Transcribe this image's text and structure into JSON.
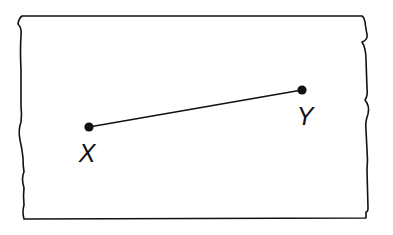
{
  "diagram": {
    "type": "line-segment",
    "colors": {
      "background": "#ffffff",
      "stroke": "#111111"
    },
    "points": [
      {
        "id": "X",
        "label": "X",
        "x": 89,
        "y": 127,
        "label_x": 87,
        "label_y": 141
      },
      {
        "id": "Y",
        "label": "Y",
        "x": 302,
        "y": 90,
        "label_x": 305,
        "label_y": 104
      }
    ],
    "segment": {
      "from": "X",
      "to": "Y"
    },
    "paper_strip": {
      "top_y": 16,
      "bottom_y": 219,
      "left_x": 22,
      "right_x": 366,
      "torn_edges": [
        "left",
        "right"
      ]
    }
  }
}
